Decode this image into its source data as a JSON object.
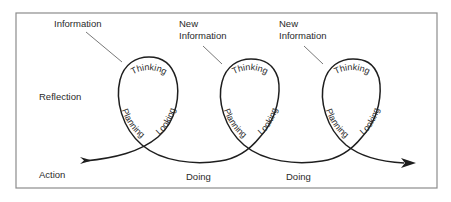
{
  "diagram": {
    "rows": {
      "reflection": "Reflection",
      "action": "Action"
    },
    "cycles": [
      {
        "input_label_line1": "Information",
        "input_label_line2": "",
        "thinking": "Thinking",
        "planning": "Planning",
        "looking": "Looking"
      },
      {
        "input_label_line1": "New",
        "input_label_line2": "Information",
        "thinking": "Thinking",
        "planning": "Planning",
        "looking": "Looking"
      },
      {
        "input_label_line1": "New",
        "input_label_line2": "Information",
        "thinking": "Thinking",
        "planning": "Planning",
        "looking": "Looking"
      }
    ],
    "doing_labels": [
      "Doing",
      "Doing"
    ],
    "colors": {
      "stroke": "#1e1e1e",
      "frame": "#8c8c8c",
      "text": "#2a2a2a"
    }
  }
}
